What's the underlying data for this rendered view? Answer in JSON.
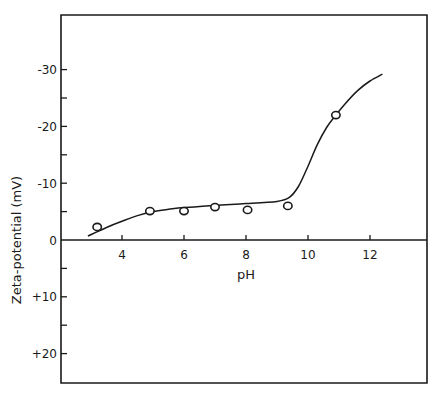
{
  "chart_data": {
    "type": "scatter",
    "title": "",
    "xlabel": "pH",
    "ylabel": "Zeta-potential (mV)",
    "xlim": [
      2,
      14
    ],
    "ylim": [
      -40,
      25
    ],
    "y_axis_inverted": true,
    "grid": false,
    "legend": null,
    "x_ticks": [
      4,
      6,
      8,
      10,
      12
    ],
    "x_tick_labels": [
      "4",
      "6",
      "8",
      "10",
      "12"
    ],
    "y_ticks": [
      -30,
      -20,
      -10,
      0,
      10,
      20
    ],
    "y_tick_labels": [
      "-30",
      "-20",
      "-10",
      "0",
      "+10",
      "+20"
    ],
    "y_minor_ticks": [
      -25,
      -15,
      -5,
      5,
      15
    ],
    "series": [
      {
        "name": "measured",
        "kind": "scatter",
        "marker": "open-circle",
        "x": [
          3.2,
          4.9,
          6.0,
          7.0,
          8.05,
          9.35,
          10.9
        ],
        "y": [
          -2.3,
          -5.1,
          -5.1,
          -5.8,
          -5.3,
          -6.0,
          -22.0
        ]
      },
      {
        "name": "fitted curve",
        "kind": "line",
        "x": [
          2.9,
          3.5,
          4.0,
          4.5,
          5.0,
          5.5,
          6.0,
          7.0,
          8.0,
          9.0,
          9.4,
          9.7,
          10.0,
          10.3,
          10.6,
          10.9,
          11.2,
          11.6,
          12.0,
          12.4
        ],
        "y": [
          -0.7,
          -2.2,
          -3.3,
          -4.3,
          -5.0,
          -5.4,
          -5.7,
          -6.1,
          -6.4,
          -6.8,
          -7.5,
          -9.5,
          -13.0,
          -16.8,
          -19.8,
          -22.0,
          -24.0,
          -26.3,
          -28.0,
          -29.2
        ]
      }
    ]
  },
  "plot_geometry": {
    "frame": {
      "left": 61,
      "top": 15,
      "right": 427,
      "bottom": 383
    },
    "x_origin_px": -2,
    "x_px_per_unit": 31,
    "y_zero_px": 240,
    "y_px_per_unit": 5.68
  }
}
